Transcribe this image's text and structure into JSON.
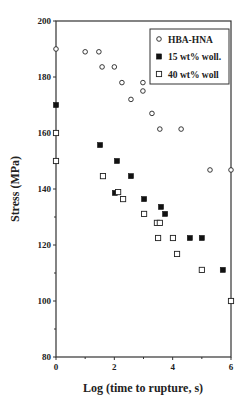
{
  "chart_data": {
    "type": "scatter",
    "title": "",
    "xlabel": "Log (time to rupture, s)",
    "ylabel": "Stress (MPa)",
    "xlim": [
      0,
      6
    ],
    "ylim": [
      80,
      200
    ],
    "x_ticks": [
      0,
      2,
      4,
      6
    ],
    "x_minor_ticks": [
      1,
      3,
      5
    ],
    "y_ticks": [
      80,
      100,
      120,
      140,
      160,
      180,
      200
    ],
    "y_minor_ticks": [
      90,
      110,
      130,
      150,
      170,
      190
    ],
    "grid": false,
    "legend_position": "upper right (inside)",
    "series": [
      {
        "name": "HBA-HNA",
        "marker": "open-circle",
        "points": [
          [
            0.0,
            190
          ],
          [
            1.0,
            189
          ],
          [
            1.47,
            189
          ],
          [
            1.58,
            183.6
          ],
          [
            2.0,
            183.6
          ],
          [
            2.26,
            178
          ],
          [
            2.98,
            178
          ],
          [
            2.98,
            175
          ],
          [
            2.57,
            172
          ],
          [
            3.29,
            167
          ],
          [
            3.56,
            161.4
          ],
          [
            4.29,
            161.4
          ],
          [
            5.28,
            146.8
          ],
          [
            6.0,
            146.8
          ]
        ]
      },
      {
        "name": "15 wt% woll.",
        "marker": "filled-square",
        "points": [
          [
            0.0,
            170
          ],
          [
            1.51,
            155.7
          ],
          [
            2.09,
            150
          ],
          [
            2.57,
            144.6
          ],
          [
            2.02,
            138.6
          ],
          [
            3.02,
            136.4
          ],
          [
            3.6,
            133.6
          ],
          [
            3.74,
            131.1
          ],
          [
            4.59,
            122.5
          ],
          [
            5.0,
            122.5
          ],
          [
            5.72,
            111.1
          ]
        ]
      },
      {
        "name": "40 wt% woll",
        "marker": "open-square",
        "points": [
          [
            0.0,
            160
          ],
          [
            0.0,
            150
          ],
          [
            1.61,
            144.6
          ],
          [
            2.13,
            138.9
          ],
          [
            2.3,
            136.4
          ],
          [
            3.02,
            131.1
          ],
          [
            3.46,
            127.9
          ],
          [
            3.56,
            127.9
          ],
          [
            3.5,
            122.5
          ],
          [
            4.01,
            122.5
          ],
          [
            4.15,
            116.8
          ],
          [
            5.0,
            111.1
          ],
          [
            6.0,
            100
          ]
        ]
      }
    ]
  }
}
